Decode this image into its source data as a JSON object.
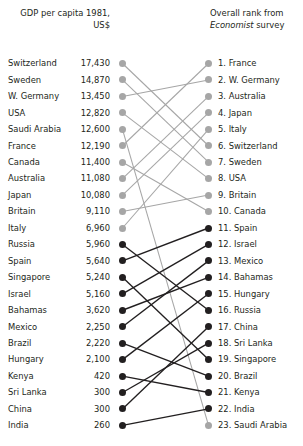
{
  "header": {
    "left_line1": "GDP per capita 1981,",
    "left_line2": "US$",
    "right_line1": "Overall rank from",
    "right_italic": "Economist",
    "right_line2_rest": " survey"
  },
  "colors": {
    "light": "#a6a6a6",
    "dark": "#221f20",
    "text": "#231f20",
    "background": "#ffffff"
  },
  "chart_data": {
    "type": "line",
    "subtype": "slopegraph",
    "left_axis_title": "GDP per capita 1981, US$",
    "right_axis_title": "Overall rank from Economist survey",
    "grid": false,
    "legend": "none",
    "left_column": [
      {
        "rank": 1,
        "country": "Switzerland",
        "value": 17430,
        "value_label": "17,430",
        "tone": "light"
      },
      {
        "rank": 2,
        "country": "Sweden",
        "value": 14870,
        "value_label": "14,870",
        "tone": "light"
      },
      {
        "rank": 3,
        "country": "W. Germany",
        "value": 13450,
        "value_label": "13,450",
        "tone": "light"
      },
      {
        "rank": 4,
        "country": "USA",
        "value": 12820,
        "value_label": "12,820",
        "tone": "light"
      },
      {
        "rank": 5,
        "country": "Saudi Arabia",
        "value": 12600,
        "value_label": "12,600",
        "tone": "light"
      },
      {
        "rank": 6,
        "country": "France",
        "value": 12190,
        "value_label": "12,190",
        "tone": "light"
      },
      {
        "rank": 7,
        "country": "Canada",
        "value": 11400,
        "value_label": "11,400",
        "tone": "light"
      },
      {
        "rank": 8,
        "country": "Australia",
        "value": 11080,
        "value_label": "11,080",
        "tone": "light"
      },
      {
        "rank": 9,
        "country": "Japan",
        "value": 10080,
        "value_label": "10,080",
        "tone": "light"
      },
      {
        "rank": 10,
        "country": "Britain",
        "value": 9110,
        "value_label": "9,110",
        "tone": "light"
      },
      {
        "rank": 11,
        "country": "Italy",
        "value": 6960,
        "value_label": "6,960",
        "tone": "light"
      },
      {
        "rank": 12,
        "country": "Russia",
        "value": 5960,
        "value_label": "5,960",
        "tone": "dark"
      },
      {
        "rank": 13,
        "country": "Spain",
        "value": 5640,
        "value_label": "5,640",
        "tone": "dark"
      },
      {
        "rank": 14,
        "country": "Singapore",
        "value": 5240,
        "value_label": "5,240",
        "tone": "dark"
      },
      {
        "rank": 15,
        "country": "Israel",
        "value": 5160,
        "value_label": "5,160",
        "tone": "dark"
      },
      {
        "rank": 16,
        "country": "Bahamas",
        "value": 3620,
        "value_label": "3,620",
        "tone": "dark"
      },
      {
        "rank": 17,
        "country": "Mexico",
        "value": 2250,
        "value_label": "2,250",
        "tone": "dark"
      },
      {
        "rank": 18,
        "country": "Brazil",
        "value": 2220,
        "value_label": "2,220",
        "tone": "dark"
      },
      {
        "rank": 19,
        "country": "Hungary",
        "value": 2100,
        "value_label": "2,100",
        "tone": "dark"
      },
      {
        "rank": 20,
        "country": "Kenya",
        "value": 420,
        "value_label": "420",
        "tone": "dark"
      },
      {
        "rank": 21,
        "country": "Sri Lanka",
        "value": 300,
        "value_label": "300",
        "tone": "dark"
      },
      {
        "rank": 22,
        "country": "China",
        "value": 300,
        "value_label": "300",
        "tone": "dark"
      },
      {
        "rank": 23,
        "country": "India",
        "value": 260,
        "value_label": "260",
        "tone": "dark"
      }
    ],
    "right_column": [
      {
        "rank": 1,
        "country": "France",
        "label": "1. France",
        "tone": "light"
      },
      {
        "rank": 2,
        "country": "W. Germany",
        "label": "2. W. Germany",
        "tone": "light"
      },
      {
        "rank": 3,
        "country": "Australia",
        "label": "3. Australia",
        "tone": "light"
      },
      {
        "rank": 4,
        "country": "Japan",
        "label": "4. Japan",
        "tone": "light"
      },
      {
        "rank": 5,
        "country": "Italy",
        "label": "5. Italy",
        "tone": "light"
      },
      {
        "rank": 6,
        "country": "Switzerland",
        "label": "6. Switzerland",
        "tone": "light"
      },
      {
        "rank": 7,
        "country": "Sweden",
        "label": "7. Sweden",
        "tone": "light"
      },
      {
        "rank": 8,
        "country": "USA",
        "label": "8. USA",
        "tone": "light"
      },
      {
        "rank": 9,
        "country": "Britain",
        "label": "9. Britain",
        "tone": "light"
      },
      {
        "rank": 10,
        "country": "Canada",
        "label": "10. Canada",
        "tone": "light"
      },
      {
        "rank": 11,
        "country": "Spain",
        "label": "11. Spain",
        "tone": "dark"
      },
      {
        "rank": 12,
        "country": "Israel",
        "label": "12. Israel",
        "tone": "dark"
      },
      {
        "rank": 13,
        "country": "Mexico",
        "label": "13. Mexico",
        "tone": "dark"
      },
      {
        "rank": 14,
        "country": "Bahamas",
        "label": "14. Bahamas",
        "tone": "dark"
      },
      {
        "rank": 15,
        "country": "Hungary",
        "label": "15. Hungary",
        "tone": "dark"
      },
      {
        "rank": 16,
        "country": "Russia",
        "label": "16. Russia",
        "tone": "dark"
      },
      {
        "rank": 17,
        "country": "China",
        "label": "17. China",
        "tone": "dark"
      },
      {
        "rank": 18,
        "country": "Sri Lanka",
        "label": "18. Sri Lanka",
        "tone": "dark"
      },
      {
        "rank": 19,
        "country": "Singapore",
        "label": "19. Singapore",
        "tone": "dark"
      },
      {
        "rank": 20,
        "country": "Brazil",
        "label": "20. Brazil",
        "tone": "dark"
      },
      {
        "rank": 21,
        "country": "Kenya",
        "label": "21. Kenya",
        "tone": "dark"
      },
      {
        "rank": 22,
        "country": "India",
        "label": "22. India",
        "tone": "dark"
      },
      {
        "rank": 23,
        "country": "Saudi Arabia",
        "label": "23. Saudi Arabia",
        "tone": "light"
      }
    ],
    "links": [
      {
        "country": "Switzerland",
        "from": 1,
        "to": 6,
        "tone": "light"
      },
      {
        "country": "Sweden",
        "from": 2,
        "to": 7,
        "tone": "light"
      },
      {
        "country": "W. Germany",
        "from": 3,
        "to": 2,
        "tone": "light"
      },
      {
        "country": "USA",
        "from": 4,
        "to": 8,
        "tone": "light"
      },
      {
        "country": "Saudi Arabia",
        "from": 5,
        "to": 23,
        "tone": "light"
      },
      {
        "country": "France",
        "from": 6,
        "to": 1,
        "tone": "light"
      },
      {
        "country": "Canada",
        "from": 7,
        "to": 10,
        "tone": "light"
      },
      {
        "country": "Australia",
        "from": 8,
        "to": 3,
        "tone": "light"
      },
      {
        "country": "Japan",
        "from": 9,
        "to": 4,
        "tone": "light"
      },
      {
        "country": "Britain",
        "from": 10,
        "to": 9,
        "tone": "light"
      },
      {
        "country": "Italy",
        "from": 11,
        "to": 5,
        "tone": "light"
      },
      {
        "country": "Russia",
        "from": 12,
        "to": 16,
        "tone": "dark"
      },
      {
        "country": "Spain",
        "from": 13,
        "to": 11,
        "tone": "dark"
      },
      {
        "country": "Singapore",
        "from": 14,
        "to": 19,
        "tone": "dark"
      },
      {
        "country": "Israel",
        "from": 15,
        "to": 12,
        "tone": "dark"
      },
      {
        "country": "Bahamas",
        "from": 16,
        "to": 14,
        "tone": "dark"
      },
      {
        "country": "Mexico",
        "from": 17,
        "to": 13,
        "tone": "dark"
      },
      {
        "country": "Brazil",
        "from": 18,
        "to": 20,
        "tone": "dark"
      },
      {
        "country": "Hungary",
        "from": 19,
        "to": 15,
        "tone": "dark"
      },
      {
        "country": "Kenya",
        "from": 20,
        "to": 21,
        "tone": "dark"
      },
      {
        "country": "Sri Lanka",
        "from": 21,
        "to": 18,
        "tone": "dark"
      },
      {
        "country": "China",
        "from": 22,
        "to": 17,
        "tone": "dark"
      },
      {
        "country": "India",
        "from": 23,
        "to": 22,
        "tone": "dark"
      }
    ]
  }
}
